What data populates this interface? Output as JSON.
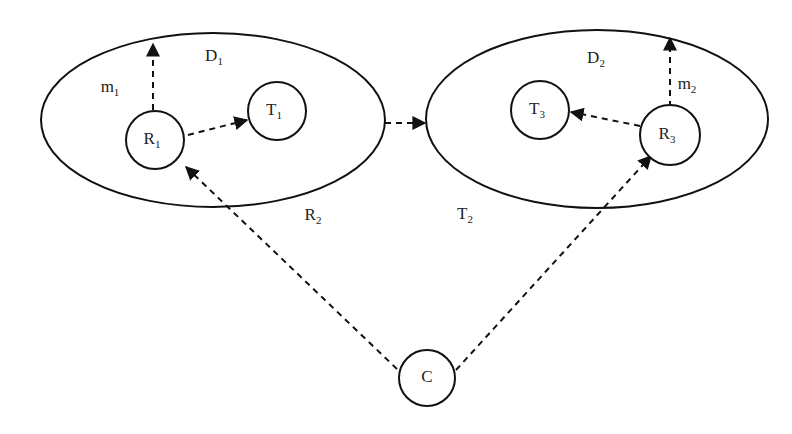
{
  "diagram": {
    "domains": [
      {
        "id": "D1",
        "label": "D",
        "sub": "1",
        "cx": 213,
        "cy": 120,
        "rx": 172,
        "ry": 87,
        "label_x": 214,
        "label_y": 57
      },
      {
        "id": "D2",
        "label": "D",
        "sub": "2",
        "cx": 597,
        "cy": 119,
        "rx": 171,
        "ry": 89,
        "label_x": 596,
        "label_y": 59
      }
    ],
    "nodes": [
      {
        "id": "R1",
        "label": "R",
        "sub": "1",
        "cx": 155,
        "cy": 140,
        "r": 29
      },
      {
        "id": "T1",
        "label": "T",
        "sub": "1",
        "cx": 277,
        "cy": 111,
        "r": 29
      },
      {
        "id": "T3",
        "label": "T",
        "sub": "3",
        "cx": 540,
        "cy": 110,
        "r": 29
      },
      {
        "id": "R3",
        "label": "R",
        "sub": "3",
        "cx": 670,
        "cy": 135,
        "r": 30
      },
      {
        "id": "C",
        "label": "C",
        "sub": "",
        "cx": 427,
        "cy": 378,
        "r": 28
      }
    ],
    "free_labels": [
      {
        "id": "m1",
        "label": "m",
        "sub": "1",
        "x": 110,
        "y": 88
      },
      {
        "id": "m2",
        "label": "m",
        "sub": "2",
        "x": 687,
        "y": 85
      },
      {
        "id": "R2",
        "label": "R",
        "sub": "2",
        "x": 313,
        "y": 216
      },
      {
        "id": "T2",
        "label": "T",
        "sub": "2",
        "x": 465,
        "y": 215
      }
    ],
    "edges": [
      {
        "id": "R1-m1",
        "from": "R1",
        "to": "D1 boundary (m1)",
        "x1": 153,
        "y1": 110,
        "x2": 153,
        "y2": 44
      },
      {
        "id": "R1-T1",
        "from": "R1",
        "to": "T1",
        "x1": 188,
        "y1": 135,
        "x2": 247,
        "y2": 120
      },
      {
        "id": "D1-D2",
        "from": "D1",
        "to": "D2",
        "x1": 385,
        "y1": 123,
        "x2": 425,
        "y2": 123
      },
      {
        "id": "R3-T3",
        "from": "R3",
        "to": "T3",
        "x1": 640,
        "y1": 126,
        "x2": 571,
        "y2": 112
      },
      {
        "id": "R3-m2",
        "from": "R3",
        "to": "D2 boundary (m2)",
        "x1": 670,
        "y1": 107,
        "x2": 670,
        "y2": 38
      },
      {
        "id": "C-R1",
        "from": "C",
        "to": "R1",
        "x1": 397,
        "y1": 369,
        "x2": 186,
        "y2": 167
      },
      {
        "id": "C-R3",
        "from": "C",
        "to": "R3",
        "x1": 456,
        "y1": 370,
        "x2": 651,
        "y2": 156
      }
    ],
    "colors": {
      "stroke": "#111111",
      "background": "#ffffff"
    }
  }
}
